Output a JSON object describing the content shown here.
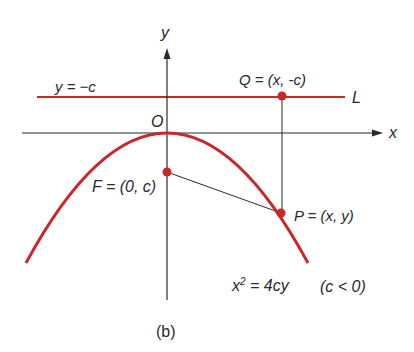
{
  "figure": {
    "caption": "(b)",
    "colors": {
      "curve": "#c8282a",
      "axis": "#2a2a2a",
      "point": "#c8282a"
    },
    "axes": {
      "x_label": "x",
      "y_label": "y",
      "origin_label": "O"
    },
    "directrix": {
      "equation_label": "y = −c",
      "name_label": "L"
    },
    "points": {
      "Q": {
        "name": "Q",
        "label": "Q = (x, -c)"
      },
      "F": {
        "name": "F",
        "label": "F = (0, c)"
      },
      "P": {
        "name": "P",
        "label": "P = (x, y)"
      }
    },
    "curve": {
      "equation_lhs": "x",
      "equation_exp": "2",
      "equation_rhs": " = 4cy",
      "condition": "(c < 0)"
    }
  }
}
